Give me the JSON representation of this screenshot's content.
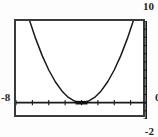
{
  "app": {
    "kind": "graphing-calculator-plot",
    "background_color": "#ffffff",
    "frame_color": "#3a3a3a",
    "curve_color": "#1a1a1a",
    "axis_color": "#1a1a1a",
    "label_color": "#231f20"
  },
  "labels": {
    "y_max": "10",
    "y_min": "-2",
    "x_min": "-8",
    "x_max": "0"
  },
  "chart_data": {
    "type": "line",
    "title": "",
    "xlabel": "",
    "ylabel": "",
    "xlim": [
      -8,
      0
    ],
    "ylim": [
      -2,
      10
    ],
    "grid": false,
    "legend": null,
    "axes": {
      "x_axis_at_y": 0,
      "y_axis_at_x": 0,
      "x_tick_step": 1,
      "y_tick_step": 1,
      "x_ticks": [
        -8,
        -7,
        -6,
        -5,
        -4,
        -3,
        -2,
        -1,
        0
      ],
      "y_ticks": [
        -2,
        -1,
        0,
        1,
        2,
        3,
        4,
        5,
        6,
        7,
        8,
        9,
        10
      ]
    },
    "series": [
      {
        "name": "parabola",
        "kind": "parabola",
        "vertex": [
          -4,
          0
        ],
        "opens": "up",
        "equation": "y = (x + 4)^2",
        "x": [
          -8.0,
          -7.6,
          -7.2,
          -6.8,
          -6.4,
          -6.0,
          -5.6,
          -5.2,
          -4.8,
          -4.4,
          -4.0,
          -3.6,
          -3.2,
          -2.8,
          -2.4,
          -2.0,
          -1.6,
          -1.2,
          -0.8,
          -0.4,
          0.0
        ],
        "values": [
          16.0,
          12.96,
          10.24,
          7.84,
          5.76,
          4.0,
          2.56,
          1.44,
          0.64,
          0.16,
          0.0,
          0.16,
          0.64,
          1.44,
          2.56,
          4.0,
          5.76,
          7.84,
          10.24,
          12.96,
          16.0
        ]
      }
    ],
    "markers": [
      {
        "name": "trace-cursor",
        "x": -4,
        "y": 0,
        "style": "thick-bar"
      }
    ]
  }
}
